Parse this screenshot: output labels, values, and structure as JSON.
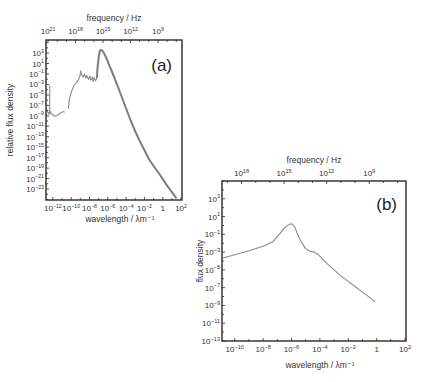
{
  "chart_data": [
    {
      "id": "a",
      "type": "line",
      "panel_label": "(a)",
      "title": "",
      "xlabel": "wavelength / λm⁻¹",
      "ylabel": "relative flux density",
      "top_axis_label": "frequency / Hz",
      "x_scale": "log",
      "y_scale": "log",
      "xlim_log10": [
        -12.75,
        2.1
      ],
      "ylim_log10": [
        -25.1,
        5.5
      ],
      "x_ticks_log10": [
        -12,
        -10,
        -8,
        -6,
        -4,
        -2,
        0,
        2
      ],
      "x_tick_labels": [
        [
          "10",
          "−12"
        ],
        [
          "10",
          "−10"
        ],
        [
          "10",
          "−8"
        ],
        [
          "10",
          "−6"
        ],
        [
          "10",
          "−4"
        ],
        [
          "10",
          "−2"
        ],
        [
          "1",
          ""
        ],
        [
          "10",
          "2"
        ]
      ],
      "y_ticks_log10": [
        3,
        1,
        -1,
        -3,
        -5,
        -7,
        -9,
        -11,
        -13,
        -15,
        -17,
        -19,
        -21,
        -23
      ],
      "y_tick_labels": [
        [
          "10",
          "3"
        ],
        [
          "10",
          "1"
        ],
        [
          "10",
          "−1"
        ],
        [
          "10",
          "−3"
        ],
        [
          "10",
          "−5"
        ],
        [
          "10",
          "−7"
        ],
        [
          "10",
          "−9"
        ],
        [
          "10",
          "−11"
        ],
        [
          "10",
          "−13"
        ],
        [
          "10",
          "−15"
        ],
        [
          "10",
          "−17"
        ],
        [
          "10",
          "−19"
        ],
        [
          "10",
          "−21"
        ],
        [
          "10",
          "−23"
        ]
      ],
      "top_ticks_log10_freq": [
        21,
        18,
        15,
        12,
        9
      ],
      "top_tick_labels": [
        [
          "10",
          "21"
        ],
        [
          "10",
          "18"
        ],
        [
          "10",
          "15"
        ],
        [
          "10",
          "12"
        ],
        [
          "10",
          "9"
        ]
      ],
      "series": [
        {
          "name": "spectrum",
          "x_log10": [
            -12.6,
            -12.5,
            -12.3,
            -12.1,
            -11.8,
            -11.5,
            -11.2,
            -10.9,
            -10.7
          ],
          "y_log10": [
            -7.8,
            -8.6,
            -8.2,
            -8.7,
            -9.1,
            -8.9,
            -8.5,
            -8.2,
            -8.3
          ]
        },
        {
          "name": "spike",
          "x_log10": [
            -12.35,
            -12.35
          ],
          "y_log10": [
            -8.8,
            -3.2
          ]
        },
        {
          "name": "spectrum-mid",
          "x_log10": [
            -10.3,
            -10.2,
            -10.0,
            -9.7,
            -9.4,
            -9.2,
            -9.05,
            -8.95,
            -8.85,
            -8.7,
            -8.55,
            -8.4,
            -8.3,
            -8.1,
            -7.95,
            -7.85,
            -7.7,
            -7.6,
            -7.5,
            -7.35,
            -7.2
          ],
          "y_log10": [
            -7.6,
            -5.8,
            -4.5,
            -3.2,
            -2.6,
            -2.1,
            -1.4,
            -0.4,
            -1.2,
            -1.6,
            -1.0,
            -1.8,
            -1.3,
            -2.0,
            -1.4,
            -2.2,
            -1.6,
            -2.4,
            -1.7,
            -2.3,
            -1.8
          ]
        },
        {
          "name": "spectrum-peak",
          "x_log10": [
            -7.2,
            -7.1,
            -7.0,
            -6.9,
            -6.8,
            -6.6,
            -6.4,
            -6.1,
            -5.8,
            -5.4,
            -5.0,
            -4.5,
            -4.0,
            -3.5,
            -3.0,
            -2.5,
            -2.0,
            -1.5,
            -1.0,
            -0.5,
            0.0,
            0.5,
            1.0,
            1.5
          ],
          "y_log10": [
            -1.8,
            0.5,
            2.2,
            3.2,
            3.6,
            3.5,
            2.9,
            1.8,
            0.5,
            -1.2,
            -3.0,
            -5.3,
            -7.6,
            -9.9,
            -12.0,
            -13.9,
            -15.6,
            -17.3,
            -18.6,
            -19.8,
            -21.1,
            -22.4,
            -23.6,
            -24.8
          ]
        }
      ]
    },
    {
      "id": "b",
      "type": "line",
      "panel_label": "(b)",
      "title": "",
      "xlabel": "wavelength / λm⁻¹",
      "ylabel": "flux density",
      "top_axis_label": "frequency / Hz",
      "x_scale": "log",
      "y_scale": "log",
      "xlim_log10": [
        -10.9,
        2.07
      ],
      "ylim_log10": [
        -13,
        5.0
      ],
      "x_ticks_log10": [
        -10,
        -8,
        -6,
        -4,
        -2,
        0,
        2
      ],
      "x_tick_labels": [
        [
          "10",
          "−10"
        ],
        [
          "10",
          "−8"
        ],
        [
          "10",
          "−6"
        ],
        [
          "10",
          "−4"
        ],
        [
          "10",
          "−2"
        ],
        [
          "1",
          ""
        ],
        [
          "10",
          "2"
        ]
      ],
      "y_ticks_log10": [
        3,
        1,
        -1,
        -3,
        -5,
        -7,
        -9,
        -11,
        -13
      ],
      "y_tick_labels": [
        [
          "10",
          "3"
        ],
        [
          "10",
          "1"
        ],
        [
          "10",
          "−1"
        ],
        [
          "10",
          "−3"
        ],
        [
          "10",
          "−5"
        ],
        [
          "10",
          "−7"
        ],
        [
          "10",
          "−9"
        ],
        [
          "10",
          "−11"
        ],
        [
          "10",
          "−13"
        ]
      ],
      "top_ticks_log10_freq": [
        18,
        15,
        12,
        9
      ],
      "top_tick_labels": [
        [
          "10",
          "18"
        ],
        [
          "10",
          "15"
        ],
        [
          "10",
          "12"
        ],
        [
          "10",
          "9"
        ]
      ],
      "series": [
        {
          "name": "flux",
          "x_log10": [
            -10.9,
            -10.0,
            -9.0,
            -8.0,
            -7.3,
            -6.9,
            -6.5,
            -6.2,
            -6.0,
            -5.8,
            -5.6,
            -5.3,
            -5.0,
            -4.7,
            -4.4,
            -4.1,
            -3.8,
            -3.5,
            -3.0,
            -2.5,
            -2.0,
            -1.5,
            -1.0,
            -0.5,
            -0.1
          ],
          "y_log10": [
            -3.7,
            -3.3,
            -2.85,
            -2.35,
            -1.8,
            -1.1,
            -0.3,
            0.1,
            0.2,
            -0.1,
            -0.9,
            -1.9,
            -2.6,
            -2.9,
            -3.0,
            -3.3,
            -3.8,
            -4.3,
            -5.0,
            -5.7,
            -6.3,
            -6.9,
            -7.5,
            -8.1,
            -8.6
          ]
        }
      ]
    }
  ]
}
